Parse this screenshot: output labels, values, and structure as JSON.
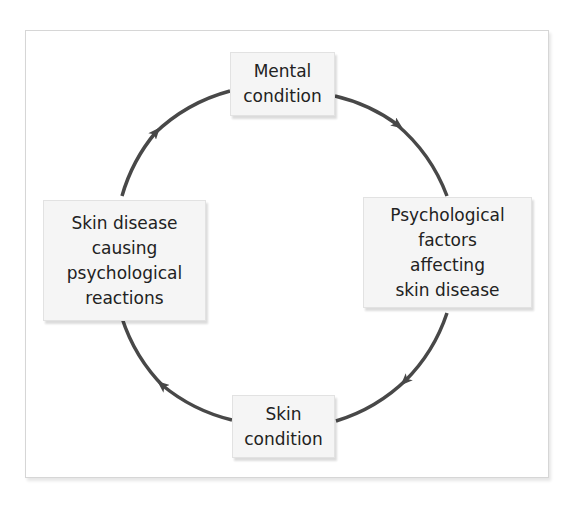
{
  "diagram": {
    "type": "cycle",
    "direction": "clockwise",
    "colors": {
      "arrow": "#484848",
      "node_fill": "#f5f5f5",
      "node_text": "#222222",
      "frame_border": "#d6d6d6"
    },
    "nodes": {
      "top": {
        "label": "Mental\ncondition"
      },
      "right": {
        "label": "Psychological\nfactors\naffecting\nskin disease"
      },
      "bottom": {
        "label": "Skin\ncondition"
      },
      "left": {
        "label": "Skin disease\ncausing\npsychological\nreactions"
      }
    },
    "edges": [
      {
        "from": "top",
        "to": "right"
      },
      {
        "from": "right",
        "to": "bottom"
      },
      {
        "from": "bottom",
        "to": "left"
      },
      {
        "from": "left",
        "to": "top"
      }
    ]
  }
}
